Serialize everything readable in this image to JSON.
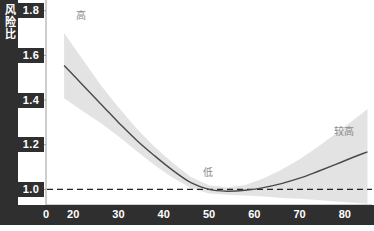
{
  "chart_data": {
    "type": "line",
    "title": "",
    "xlabel": "",
    "ylabel": "风险比",
    "xlim": [
      14,
      86
    ],
    "ylim": [
      0.93,
      1.83
    ],
    "grid": false,
    "legend": null,
    "xticks": [
      20,
      30,
      40,
      50,
      60,
      70,
      80
    ],
    "xtick_labels": [
      "20",
      "30",
      "40",
      "50",
      "60",
      "70",
      "80"
    ],
    "origin_label": "0",
    "yticks": [
      1.0,
      1.2,
      1.4,
      1.6,
      1.8
    ],
    "ytick_labels": [
      "1.0",
      "1.2",
      "1.4",
      "1.6",
      "1.8"
    ],
    "reference_line": {
      "y": 1.0,
      "style": "dashed",
      "color": "#222222"
    },
    "series": [
      {
        "name": "风险比估计",
        "type": "line",
        "color": "#4a4a4a",
        "x": [
          18,
          22,
          26,
          30,
          34,
          38,
          42,
          46,
          50,
          54,
          58,
          62,
          66,
          70,
          74,
          78,
          82,
          85
        ],
        "values": [
          1.555,
          1.47,
          1.385,
          1.3,
          1.22,
          1.15,
          1.085,
          1.03,
          1.0,
          0.992,
          0.996,
          1.008,
          1.026,
          1.05,
          1.08,
          1.112,
          1.145,
          1.168
        ]
      },
      {
        "name": "置信区间",
        "type": "band",
        "color": "#e3e3e3",
        "x": [
          18,
          22,
          26,
          30,
          34,
          38,
          42,
          46,
          50,
          54,
          58,
          62,
          66,
          70,
          74,
          78,
          82,
          85
        ],
        "upper": [
          1.7,
          1.585,
          1.47,
          1.368,
          1.272,
          1.19,
          1.118,
          1.056,
          1.018,
          1.008,
          1.02,
          1.048,
          1.088,
          1.135,
          1.19,
          1.25,
          1.312,
          1.36
        ],
        "lower": [
          1.408,
          1.352,
          1.298,
          1.238,
          1.172,
          1.108,
          1.052,
          1.006,
          0.982,
          0.976,
          0.972,
          0.968,
          0.962,
          0.958,
          0.952,
          0.946,
          0.94,
          0.936
        ]
      }
    ],
    "annotations": [
      {
        "id": "high",
        "text": "高",
        "x": 22,
        "y": 1.775,
        "color": "#8a8a8a"
      },
      {
        "id": "low",
        "text": "低",
        "x": 50,
        "y": 1.075,
        "color": "#8a8a8a"
      },
      {
        "id": "fairly-high",
        "text": "较高",
        "x": 79,
        "y": 1.255,
        "color": "#8a8a8a"
      }
    ]
  },
  "axis": {
    "y_title": "风险比",
    "origin": "0"
  }
}
